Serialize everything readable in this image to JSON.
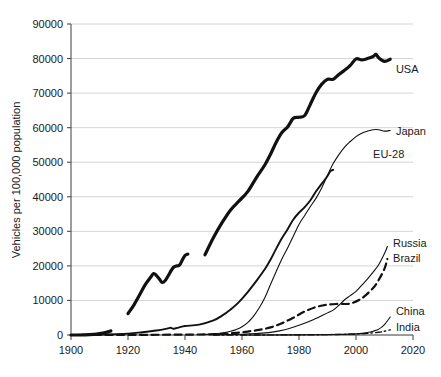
{
  "chart_data": {
    "type": "line",
    "title": "",
    "xlabel": "",
    "ylabel": "Vehicles per 100,000 population",
    "xlim": [
      1900,
      2020
    ],
    "ylim": [
      0,
      90000
    ],
    "grid": true,
    "legend_position": "inline-right-end-labels",
    "xticks": [
      "1900",
      "1920",
      "1940",
      "1960",
      "1980",
      "2000",
      "2020"
    ],
    "yticks": [
      "0",
      "10000",
      "20000",
      "30000",
      "40000",
      "50000",
      "60000",
      "70000",
      "80000",
      "90000"
    ],
    "series": [
      {
        "name": "USA",
        "label": "USA",
        "style": "thick-solid",
        "color": "#111111",
        "width": 3.2,
        "segments": [
          {
            "x": [
              1900,
              1905,
              1908,
              1910,
              1912,
              1914
            ],
            "values": [
              0,
              60,
              200,
              400,
              700,
              1200
            ]
          },
          {
            "x": [
              1920,
              1922,
              1924,
              1926,
              1928,
              1929,
              1930,
              1931,
              1932,
              1933,
              1934,
              1936,
              1938,
              1939,
              1940,
              1941
            ],
            "values": [
              6200,
              8600,
              11500,
              14500,
              16800,
              17800,
              17200,
              16200,
              15200,
              15700,
              17000,
              19600,
              20200,
              21600,
              23000,
              23400
            ]
          },
          {
            "x": [
              1947,
              1950,
              1953,
              1956,
              1959,
              1962,
              1965,
              1968,
              1970,
              1972,
              1974,
              1976,
              1978,
              1980,
              1982,
              1984,
              1986,
              1988,
              1990,
              1992,
              1994,
              1996,
              1998,
              2000,
              2002,
              2004,
              2006,
              2007,
              2008,
              2010,
              2012
            ],
            "values": [
              23200,
              28200,
              32500,
              36200,
              38800,
              41500,
              45500,
              49200,
              52300,
              55800,
              58600,
              60200,
              62700,
              63000,
              63500,
              66800,
              70200,
              72600,
              74000,
              74000,
              75400,
              76600,
              78000,
              79900,
              79600,
              80000,
              80600,
              81200,
              80200,
              79200,
              79800
            ]
          }
        ]
      },
      {
        "name": "Japan",
        "label": "Japan",
        "style": "thin-solid",
        "color": "#111111",
        "width": 1.1,
        "segments": [
          {
            "x": [
              1947,
              1950,
              1953,
              1956,
              1958,
              1960,
              1962,
              1964,
              1966,
              1968,
              1970,
              1972,
              1974,
              1976,
              1978,
              1980,
              1982,
              1984,
              1986,
              1988,
              1990,
              1992,
              1994,
              1996,
              1998,
              2000,
              2002,
              2004,
              2006,
              2008,
              2010,
              2012
            ],
            "values": [
              150,
              300,
              600,
              1100,
              1600,
              2400,
              3600,
              5400,
              7800,
              10800,
              14600,
              18400,
              22000,
              25200,
              28600,
              32000,
              34600,
              37200,
              39600,
              42600,
              46200,
              49600,
              52200,
              54400,
              56000,
              57400,
              58400,
              59000,
              59400,
              59400,
              59000,
              59200
            ]
          }
        ]
      },
      {
        "name": "EU-28",
        "label": "EU-28",
        "style": "medium-solid",
        "color": "#111111",
        "width": 1.9,
        "segments": [
          {
            "x": [
              1900,
              1910,
              1920,
              1925,
              1930,
              1934,
              1935,
              1936,
              1938,
              1940,
              1945,
              1950,
              1953,
              1956,
              1959,
              1962,
              1965,
              1968,
              1970,
              1972,
              1974,
              1976,
              1978,
              1980,
              1982,
              1984,
              1986,
              1988,
              1990,
              1991,
              1992
            ],
            "values": [
              0,
              120,
              400,
              800,
              1300,
              1900,
              2100,
              1800,
              2200,
              2600,
              3000,
              4200,
              5600,
              7400,
              9600,
              12400,
              15600,
              19000,
              21800,
              25000,
              28000,
              30600,
              33400,
              35400,
              37000,
              39000,
              41600,
              43800,
              46000,
              47400,
              47800
            ]
          }
        ]
      },
      {
        "name": "Russia",
        "label": "Russia",
        "style": "thin-solid",
        "color": "#111111",
        "width": 1.1,
        "segments": [
          {
            "x": [
              1950,
              1955,
              1960,
              1965,
              1970,
              1975,
              1980,
              1985,
              1990,
              1992,
              1994,
              1996,
              1998,
              2000,
              2002,
              2004,
              2006,
              2008,
              2010,
              2011
            ],
            "values": [
              60,
              120,
              220,
              420,
              760,
              1500,
              2800,
              4400,
              6400,
              7200,
              8600,
              10200,
              11400,
              12600,
              14400,
              16200,
              18200,
              20400,
              23600,
              25600
            ]
          }
        ]
      },
      {
        "name": "Brazil",
        "label": "Brazil",
        "style": "dashed",
        "color": "#111111",
        "width": 2.2,
        "segments": [
          {
            "x": [
              1900,
              1920,
              1935,
              1945,
              1950,
              1954,
              1958,
              1962,
              1966,
              1970,
              1974,
              1978,
              1982,
              1986,
              1990,
              1994,
              1998,
              2002,
              2006,
              2008,
              2010,
              2011
            ],
            "values": [
              0,
              40,
              90,
              150,
              230,
              380,
              620,
              1000,
              1500,
              2200,
              3400,
              5000,
              6800,
              8100,
              8800,
              9000,
              9100,
              10600,
              13600,
              16000,
              19200,
              22000
            ]
          }
        ]
      },
      {
        "name": "China",
        "label": "China",
        "style": "thin-solid",
        "color": "#111111",
        "width": 1.1,
        "segments": [
          {
            "x": [
              1960,
              1970,
              1980,
              1985,
              1990,
              1995,
              1998,
              2000,
              2002,
              2004,
              2006,
              2008,
              2010,
              2012
            ],
            "values": [
              10,
              20,
              40,
              70,
              110,
              180,
              260,
              340,
              480,
              700,
              1100,
              1700,
              3000,
              5200
            ]
          }
        ]
      },
      {
        "name": "India",
        "label": "India",
        "style": "dash-dot",
        "color": "#111111",
        "width": 1.4,
        "segments": [
          {
            "x": [
              1950,
              1960,
              1970,
              1980,
              1990,
              1995,
              2000,
              2004,
              2008,
              2010,
              2012
            ],
            "values": [
              5,
              12,
              25,
              50,
              110,
              180,
              300,
              480,
              800,
              1100,
              1500
            ]
          }
        ]
      }
    ],
    "label_anchors": [
      {
        "name": "USA",
        "x": 2014,
        "y": 77000
      },
      {
        "name": "Japan",
        "x": 2014,
        "y": 59000
      },
      {
        "name": "EU-28",
        "x": 2006,
        "y": 52500
      },
      {
        "name": "Russia",
        "x": 2013,
        "y": 26500
      },
      {
        "name": "Brazil",
        "x": 2013,
        "y": 22200
      },
      {
        "name": "China",
        "x": 2014,
        "y": 7000
      },
      {
        "name": "India",
        "x": 2014,
        "y": 2200
      }
    ]
  }
}
